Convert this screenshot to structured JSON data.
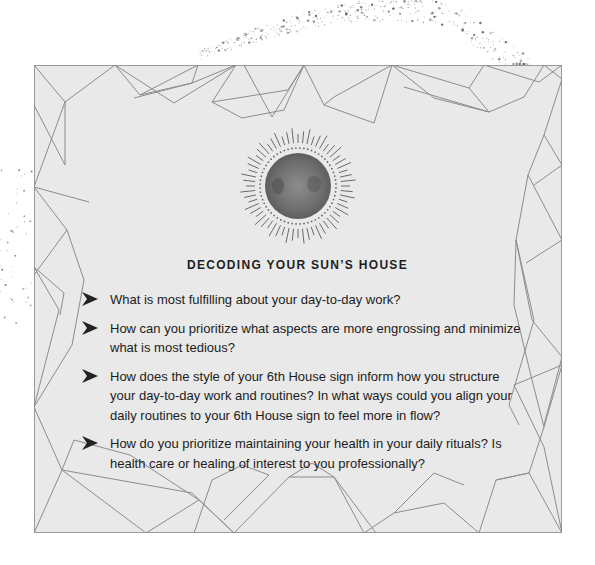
{
  "section": {
    "heading": "DECODING YOUR SUN’S HOUSE",
    "icon": "sun-icon",
    "bullet_icon": "arrowhead-bullet-icon"
  },
  "questions": [
    {
      "text": "What is most fulfilling about your day-to-day work?"
    },
    {
      "text": "How can you prioritize what aspects are more engrossing and minimize what is most tedious?"
    },
    {
      "text": "How does the style of your 6th House sign inform how you structure your day-to-day work and routines? In what ways could you align your daily routines to your 6th House sign to feel more in flow?"
    },
    {
      "text": "How do you prioritize maintaining your health in your daily rituals? Is health care or healing of interest to you professionally?"
    }
  ],
  "colors": {
    "card_background": "#e9e9e9",
    "line": "#8c8c8c",
    "text": "#1c1c1c"
  }
}
